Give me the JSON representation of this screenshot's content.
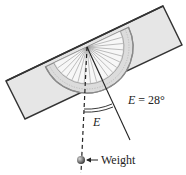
{
  "figure": {
    "type": "protractor-inclinometer-diagram",
    "angle_label": "E",
    "angle_equation": "E = 28°",
    "angle_value_deg": 28,
    "weight_label": "Weight",
    "colors": {
      "board_fill": "#e6e6e6",
      "board_stroke": "#333333",
      "protractor_fill": "#d9d9d9",
      "protractor_stroke": "#8a8a8a",
      "line": "#222222",
      "background": "#ffffff"
    }
  }
}
